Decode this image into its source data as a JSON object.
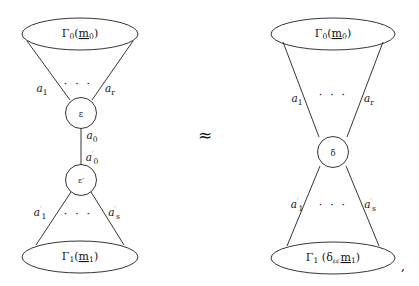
{
  "figure": {
    "kind": "commutative-diagram-pair",
    "relation_symbol": "≈",
    "trailing_punctuation": ",",
    "left_diagram": {
      "name": "composite-bipartite-graph",
      "top_ellipse_label": {
        "gamma": "Γ",
        "gamma_sub": "0",
        "open_paren": "(",
        "arg": "m",
        "arg_sub": "0",
        "close_paren": ")",
        "full": "Γ0(m0)"
      },
      "bottom_ellipse_label": {
        "gamma": "Γ",
        "gamma_sub": "1",
        "open_paren": "(",
        "arg": "m",
        "arg_sub": "1",
        "close_paren": ")",
        "full": "Γ1(m1)"
      },
      "upper_node_label": "ε",
      "lower_node_label": "ε′",
      "upper_edges": {
        "first": "a",
        "first_sub": "1",
        "last": "a",
        "last_sub": "r",
        "ellipsis": "· · ·"
      },
      "lower_edges": {
        "first": "a′",
        "first_sub": "1",
        "last": "a′",
        "last_sub": "s",
        "ellipsis": "· · ·"
      },
      "middle_edge_upper": {
        "name": "a",
        "sub": "0"
      },
      "middle_edge_lower": {
        "name": "a′",
        "sub": "0"
      }
    },
    "right_diagram": {
      "name": "contracted-bipartite-graph",
      "top_ellipse_label": {
        "gamma": "Γ",
        "gamma_sub": "0",
        "open_paren": "(",
        "arg": "m",
        "arg_sub": "0",
        "close_paren": ")",
        "full": "Γ0(m0)"
      },
      "bottom_ellipse_label": {
        "gamma": "Γ",
        "gamma_sub": "1",
        "open_paren": "(",
        "delta": "δ",
        "delta_sub": "εε′",
        "arg": "m",
        "arg_sub": "1",
        "close_paren": ")",
        "full": "Γ1(δεε′m1)"
      },
      "center_node_label": "δ",
      "upper_edges": {
        "first": "a",
        "first_sub": "1",
        "last": "a",
        "last_sub": "r",
        "ellipsis": "· · ·"
      },
      "lower_edges": {
        "first": "a′",
        "first_sub": "1",
        "last": "a′",
        "last_sub": "s",
        "ellipsis": "· · ·"
      }
    }
  },
  "style": {
    "stroke_color": "#1f1f1f",
    "text_color": "#141414",
    "background": "#ffffff"
  }
}
